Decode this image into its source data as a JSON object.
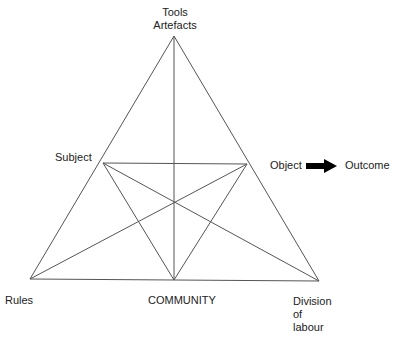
{
  "diagram": {
    "nodes": {
      "top": {
        "label_line1": "Tools",
        "label_line2": "Artefacts"
      },
      "subject": {
        "label": "Subject"
      },
      "object": {
        "label": "Object"
      },
      "outcome": {
        "label": "Outcome"
      },
      "rules": {
        "label": "Rules"
      },
      "community": {
        "label": "COMMUNITY"
      },
      "division": {
        "label_line1": "Division",
        "label_line2": "of",
        "label_line3": "labour"
      }
    },
    "arrow": {
      "from": "Object",
      "to": "Outcome"
    },
    "colors": {
      "line": "#555555",
      "text": "#222222",
      "arrow": "#000000",
      "background": "#ffffff"
    }
  }
}
